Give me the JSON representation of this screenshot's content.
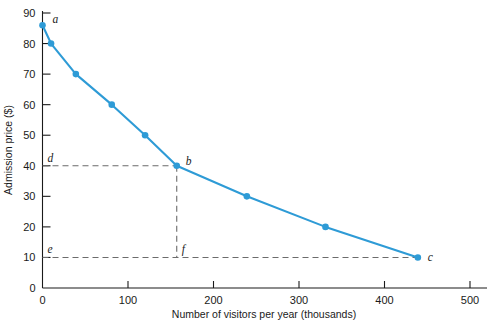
{
  "chart_data": {
    "type": "line",
    "title": "",
    "subtitle": "",
    "xlabel": "Number of visitors per year (thousands)",
    "ylabel": "Admission price ($)",
    "xlim": [
      0,
      500
    ],
    "ylim": [
      0,
      90
    ],
    "xticks": [
      0,
      100,
      200,
      300,
      400,
      500
    ],
    "yticks": [
      0,
      10,
      20,
      30,
      40,
      50,
      60,
      70,
      80,
      90
    ],
    "grid": false,
    "legend": "none",
    "series": [
      {
        "name": "Demand curve",
        "color": "#2e9bd6",
        "x": [
          0,
          10,
          39,
          81,
          120,
          157,
          239,
          331,
          439
        ],
        "y": [
          86,
          80,
          70,
          60,
          50,
          40,
          30,
          20,
          10
        ]
      }
    ],
    "annotations": [
      {
        "label": "a",
        "x": 0,
        "y": 86,
        "kind": "point-label"
      },
      {
        "label": "b",
        "x": 157,
        "y": 40,
        "kind": "point-label"
      },
      {
        "label": "c",
        "x": 439,
        "y": 10,
        "kind": "point-label"
      },
      {
        "label": "d",
        "x": 0,
        "y": 40,
        "kind": "axis-label"
      },
      {
        "label": "e",
        "x": 0,
        "y": 10,
        "kind": "axis-label"
      },
      {
        "label": "f",
        "x": 157,
        "y": 10,
        "kind": "axis-label"
      }
    ],
    "guides": [
      {
        "name": "d-to-b-horizontal",
        "x1": 0,
        "y1": 40,
        "x2": 157,
        "y2": 40
      },
      {
        "name": "b-to-f-vertical",
        "x1": 157,
        "y1": 40,
        "x2": 157,
        "y2": 10
      },
      {
        "name": "e-to-c-horizontal",
        "x1": 0,
        "y1": 10,
        "x2": 439,
        "y2": 10
      }
    ]
  },
  "axes": {
    "y_title": "Admission price ($)",
    "x_title": "Number of visitors per year (thousands)",
    "x_tick_labels": [
      "0",
      "100",
      "200",
      "300",
      "400",
      "500"
    ],
    "y_tick_labels": [
      "0",
      "10",
      "20",
      "30",
      "40",
      "50",
      "60",
      "70",
      "80",
      "90"
    ]
  },
  "labels": {
    "a": "a",
    "b": "b",
    "c": "c",
    "d": "d",
    "e": "e",
    "f": "f"
  },
  "colors": {
    "series": "#2e9bd6",
    "axis": "#1a1a1a",
    "guide": "#6b6b6b",
    "background": "#ffffff"
  }
}
